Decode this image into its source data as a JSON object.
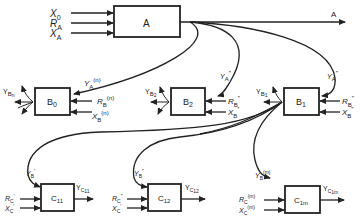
{
  "diagram": {
    "blocks": {
      "A": {
        "label": "A",
        "inputs": [
          "X₀",
          "R_A",
          "X_A"
        ],
        "output": "A"
      },
      "B0": {
        "label": "B",
        "sub": "0",
        "inputs": [
          "Y_A^(n)",
          "R_B^(n)",
          "X_B^(n)"
        ],
        "output": "Y_Bn"
      },
      "B2": {
        "label": "B",
        "sub": "2",
        "inputs": [
          "Y_A''",
          "R_B''",
          "X_B''"
        ],
        "output": "Y_B2"
      },
      "B1": {
        "label": "B",
        "sub": "1",
        "inputs": [
          "Y_A'",
          "R_B''",
          "X_B''"
        ],
        "output": "Y_B1"
      },
      "C11": {
        "label": "C",
        "sub": "11",
        "inputs": [
          "Y_B1'",
          "R_C'",
          "X_C'"
        ],
        "output": "Y_C11"
      },
      "C12": {
        "label": "C",
        "sub": "12",
        "inputs": [
          "Y_B1''",
          "R_C''",
          "X_C'"
        ],
        "output": "Y_C12"
      },
      "C1m": {
        "label": "C",
        "sub": "1m",
        "inputs": [
          "Y_B1^(m)",
          "R_C^(m)",
          "X_C^(m)"
        ],
        "output": "Y_C1m"
      }
    },
    "text": {
      "X": "X",
      "R": "R",
      "Y": "Y",
      "A": "A",
      "B": "B",
      "C": "C",
      "sub0": "0",
      "subA": "A",
      "subB": "B",
      "subC": "C",
      "n": "(n)",
      "m": "(m)",
      "pp": "″",
      "p": "′",
      "sub_n": "n",
      "sub_1": "1",
      "sub_2": "2",
      "sub_11": "11",
      "sub_12": "12",
      "sub_1m": "1m",
      "subB1": "B",
      "subC11": "C",
      "output_A": "A"
    }
  }
}
